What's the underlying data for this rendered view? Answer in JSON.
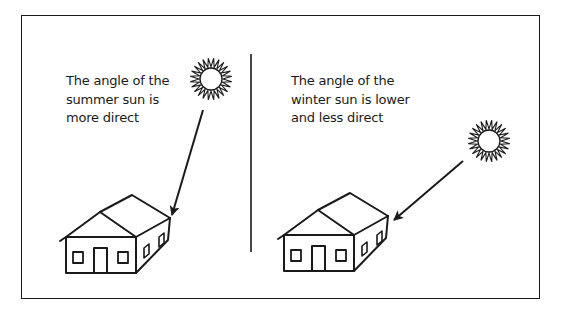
{
  "diagram": {
    "panels": [
      {
        "id": "summer",
        "caption_lines": [
          "The angle of the",
          "summer sun is",
          "more direct"
        ],
        "sun": {
          "cx": 211,
          "cy": 79
        },
        "arrow": {
          "x1": 203,
          "y1": 110,
          "x2": 172,
          "y2": 215
        }
      },
      {
        "id": "winter",
        "caption_lines": [
          "The angle of the",
          "winter sun is lower",
          "and less direct"
        ],
        "sun": {
          "cx": 489,
          "cy": 141
        },
        "arrow": {
          "x1": 463,
          "y1": 161,
          "x2": 394,
          "y2": 220
        }
      }
    ],
    "colors": {
      "line": "#1a1a1a",
      "background": "#ffffff"
    }
  }
}
